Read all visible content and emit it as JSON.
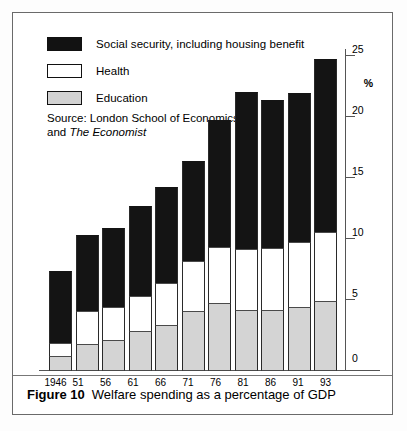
{
  "figure": {
    "number_label": "Figure 10",
    "caption": "Welfare spending as a percentage of GDP"
  },
  "legend": {
    "items": [
      {
        "label": "Social security, including housing benefit",
        "color": "#141414",
        "key": "social_security"
      },
      {
        "label": "Health",
        "color": "#ffffff",
        "key": "health"
      },
      {
        "label": "Education",
        "color": "#d4d4d4",
        "key": "education"
      }
    ]
  },
  "source": {
    "line1": "Source: London School of Economics",
    "line2_prefix": "and ",
    "line2_italic": "The Economist"
  },
  "axis": {
    "y_unit": "%",
    "y_ticks": [
      "25",
      "20",
      "15",
      "10",
      "5",
      "0"
    ]
  },
  "chart_data": {
    "type": "bar",
    "title": "Welfare spending as a percentage of GDP",
    "subtitle": "",
    "xlabel": "",
    "ylabel": "%",
    "ylim": [
      0,
      25
    ],
    "yticks": [
      0,
      5,
      10,
      15,
      20,
      25
    ],
    "grid": false,
    "stacked": true,
    "legend_position": "top-left",
    "categories": [
      "1946",
      "51",
      "56",
      "61",
      "66",
      "71",
      "76",
      "81",
      "86",
      "91",
      "93"
    ],
    "series": [
      {
        "name": "Education",
        "color": "#d4d4d4",
        "values": [
          1.2,
          2.1,
          2.4,
          3.1,
          3.6,
          4.7,
          5.3,
          4.8,
          4.8,
          5.0,
          5.5
        ]
      },
      {
        "name": "Health",
        "color": "#ffffff",
        "values": [
          1.0,
          2.6,
          2.6,
          2.8,
          3.3,
          3.9,
          4.4,
          4.7,
          4.8,
          5.1,
          5.4
        ]
      },
      {
        "name": "Social security, including housing benefit",
        "color": "#141414",
        "values": [
          5.6,
          5.9,
          6.2,
          7.0,
          7.5,
          7.8,
          9.9,
          12.3,
          11.6,
          11.6,
          13.5
        ]
      }
    ],
    "totals": [
      7.8,
      10.6,
      11.2,
      12.9,
      14.4,
      16.4,
      19.6,
      21.8,
      21.2,
      21.7,
      24.4
    ],
    "source": "London School of Economics and The Economist",
    "annotations": []
  }
}
